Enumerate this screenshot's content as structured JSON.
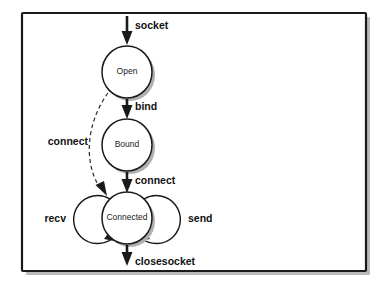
{
  "diagram": {
    "type": "state-machine",
    "frame": {
      "border_color": "#1a1a1a",
      "background_color": "#ffffff",
      "shadow_color": "#b9b9b9"
    },
    "states": [
      {
        "id": "open",
        "label": "Open",
        "cx": 127,
        "cy": 72,
        "r": 25
      },
      {
        "id": "bound",
        "label": "Bound",
        "cx": 127,
        "cy": 145,
        "r": 25
      },
      {
        "id": "connected",
        "label": "Connected",
        "cx": 127,
        "cy": 218,
        "r": 25
      }
    ],
    "transitions": [
      {
        "id": "socket",
        "label": "socket",
        "from": "",
        "to": "open",
        "style": "solid",
        "label_x": 135,
        "label_y": 26
      },
      {
        "id": "bind",
        "label": "bind",
        "from": "open",
        "to": "bound",
        "style": "solid",
        "label_x": 135,
        "label_y": 107
      },
      {
        "id": "connect-b-c",
        "label": "connect",
        "from": "bound",
        "to": "connected",
        "style": "solid",
        "label_x": 135,
        "label_y": 181
      },
      {
        "id": "connect-o-c",
        "label": "connect",
        "from": "open",
        "to": "connected",
        "style": "dashed",
        "label_x": 72,
        "label_y": 142
      },
      {
        "id": "recv",
        "label": "recv",
        "from": "connected",
        "to": "connected",
        "style": "loop",
        "label_x": 50,
        "label_y": 219
      },
      {
        "id": "send",
        "label": "send",
        "from": "connected",
        "to": "connected",
        "style": "loop",
        "label_x": 204,
        "label_y": 219
      },
      {
        "id": "closesocket",
        "label": "closesocket",
        "from": "connected",
        "to": "",
        "style": "solid",
        "label_x": 135,
        "label_y": 262
      }
    ]
  }
}
